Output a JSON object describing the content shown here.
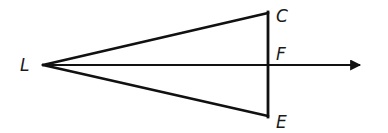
{
  "diagram": {
    "type": "geometry-figure",
    "stroke_color": "#111111",
    "background": "#ffffff",
    "points": {
      "L": {
        "label": "L",
        "x": 43,
        "y": 65,
        "label_x": 20,
        "label_y": 71
      },
      "C": {
        "label": "C",
        "x": 268,
        "y": 13,
        "label_x": 276,
        "label_y": 22
      },
      "F": {
        "label": "F",
        "x": 268,
        "y": 65,
        "label_x": 276,
        "label_y": 60
      },
      "E": {
        "label": "E",
        "x": 268,
        "y": 116,
        "label_x": 276,
        "label_y": 128
      }
    },
    "segments": [
      {
        "from": "L",
        "to": "C"
      },
      {
        "from": "L",
        "to": "E"
      },
      {
        "from": "C",
        "to": "E"
      }
    ],
    "rays": [
      {
        "from": "L",
        "through": "F",
        "end_x": 373,
        "end_y": 65,
        "arrowhead": true
      }
    ]
  }
}
